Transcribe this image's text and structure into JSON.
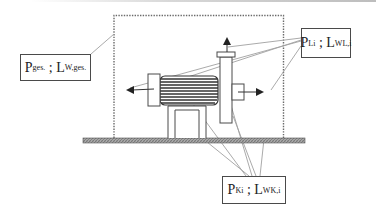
{
  "diagram": {
    "type": "sound power measurement schematic (motor-pump unit on ground plane)",
    "labels": {
      "total": {
        "main": "P",
        "sub1": "ges.",
        "sep": " ; ",
        "main2": "L",
        "sub2": "W,ges."
      },
      "airborne": {
        "main": "P",
        "sub1": "Li",
        "sep": " ; ",
        "main2": "L",
        "sub2": "WL,i"
      },
      "structure": {
        "main": "P",
        "sub1": "Ki",
        "sep": " ; ",
        "main2": "L",
        "sub2": "WK,i"
      }
    },
    "elements": [
      "dotted enveloping measurement surface",
      "hatched ground plane",
      "electric motor with cooling fins",
      "pump column with top flange",
      "outlet nozzle",
      "motor base foot",
      "radiation arrows (left, up, right)",
      "leader lines from labels to components"
    ],
    "colors": {
      "line": "#4a4a4a",
      "leader": "#9a9a9a",
      "ground_fill": "#8c8c8c",
      "dotted": "#6a6a6a"
    }
  }
}
